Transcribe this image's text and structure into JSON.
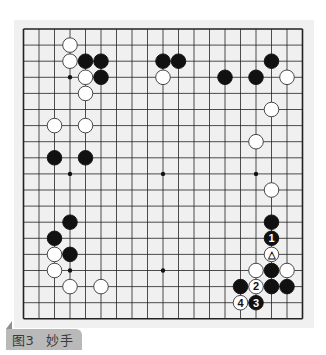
{
  "figure": {
    "caption_label": "图3",
    "caption_title": "妙手"
  },
  "board": {
    "size": 19,
    "origin_x": 23.5,
    "origin_y": 29,
    "spacing_x": 15.5,
    "spacing_y": 16.1,
    "line_color": "#222222",
    "background": "#f0f0f0",
    "star_points": [
      [
        3,
        3
      ],
      [
        9,
        3
      ],
      [
        15,
        3
      ],
      [
        3,
        9
      ],
      [
        9,
        9
      ],
      [
        15,
        9
      ],
      [
        3,
        15
      ],
      [
        9,
        15
      ],
      [
        15,
        15
      ]
    ],
    "stones": [
      {
        "color": "white",
        "col": 3,
        "row": 1
      },
      {
        "color": "white",
        "col": 3,
        "row": 2
      },
      {
        "color": "black",
        "col": 4,
        "row": 2
      },
      {
        "color": "black",
        "col": 5,
        "row": 2
      },
      {
        "color": "white",
        "col": 4,
        "row": 3
      },
      {
        "color": "black",
        "col": 5,
        "row": 3
      },
      {
        "color": "white",
        "col": 4,
        "row": 4
      },
      {
        "color": "black",
        "col": 9,
        "row": 2
      },
      {
        "color": "black",
        "col": 10,
        "row": 2
      },
      {
        "color": "white",
        "col": 9,
        "row": 3
      },
      {
        "color": "black",
        "col": 13,
        "row": 3
      },
      {
        "color": "black",
        "col": 15,
        "row": 3
      },
      {
        "color": "black",
        "col": 16,
        "row": 2
      },
      {
        "color": "white",
        "col": 17,
        "row": 3
      },
      {
        "color": "white",
        "col": 16,
        "row": 5
      },
      {
        "color": "white",
        "col": 2,
        "row": 6
      },
      {
        "color": "white",
        "col": 4,
        "row": 6
      },
      {
        "color": "black",
        "col": 2,
        "row": 8
      },
      {
        "color": "black",
        "col": 4,
        "row": 8
      },
      {
        "color": "white",
        "col": 15,
        "row": 7
      },
      {
        "color": "white",
        "col": 16,
        "row": 10
      },
      {
        "color": "black",
        "col": 16,
        "row": 12
      },
      {
        "color": "black",
        "col": 16,
        "row": 13,
        "label": "1"
      },
      {
        "color": "white",
        "col": 16,
        "row": 14,
        "label": "△"
      },
      {
        "color": "white",
        "col": 15,
        "row": 15
      },
      {
        "color": "black",
        "col": 16,
        "row": 15
      },
      {
        "color": "white",
        "col": 17,
        "row": 15
      },
      {
        "color": "black",
        "col": 14,
        "row": 16
      },
      {
        "color": "white",
        "col": 15,
        "row": 16,
        "label": "2"
      },
      {
        "color": "black",
        "col": 16,
        "row": 16
      },
      {
        "color": "black",
        "col": 17,
        "row": 16
      },
      {
        "color": "white",
        "col": 14,
        "row": 17,
        "label": "4"
      },
      {
        "color": "black",
        "col": 15,
        "row": 17,
        "label": "3"
      },
      {
        "color": "black",
        "col": 3,
        "row": 12
      },
      {
        "color": "black",
        "col": 2,
        "row": 13
      },
      {
        "color": "white",
        "col": 2,
        "row": 14
      },
      {
        "color": "black",
        "col": 3,
        "row": 14
      },
      {
        "color": "white",
        "col": 2,
        "row": 15
      },
      {
        "color": "white",
        "col": 3,
        "row": 16
      },
      {
        "color": "white",
        "col": 5,
        "row": 16
      }
    ]
  }
}
